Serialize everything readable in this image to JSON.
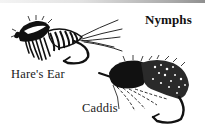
{
  "section": {
    "title": "Nymphs"
  },
  "flies": [
    {
      "id": "hares-ear",
      "label": "Hare's Ear",
      "icon": "hares-ear-nymph-fly-illustration"
    },
    {
      "id": "caddis",
      "label": "Caddis",
      "icon": "caddis-nymph-fly-illustration"
    }
  ],
  "colors": {
    "ink": "#111111",
    "background": "#ffffff",
    "rule_start": "#f4f4f4",
    "rule_end": "#8f8f8f"
  }
}
